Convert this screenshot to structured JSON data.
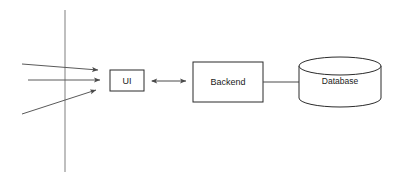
{
  "diagram": {
    "background_color": "#ffffff",
    "stroke_color": "#2b2b2b",
    "nodes": [
      {
        "id": "ui",
        "label": "UI",
        "shape": "rectangle",
        "x": 110,
        "y": 70,
        "width": 34,
        "height": 21
      },
      {
        "id": "backend",
        "label": "Backend",
        "shape": "rectangle",
        "x": 193,
        "y": 62,
        "width": 70,
        "height": 40
      },
      {
        "id": "database",
        "label": "Database",
        "shape": "cylinder",
        "x": 298,
        "y": 57,
        "width": 82,
        "height": 50
      }
    ],
    "connectors": [
      {
        "id": "ui-backend",
        "from": "ui",
        "to": "backend",
        "style": "double-arrow",
        "x1": 150,
        "y1": 81,
        "x2": 188,
        "y2": 81
      },
      {
        "id": "backend-database",
        "from": "backend",
        "to": "database",
        "style": "plain-line",
        "x1": 263,
        "y1": 82,
        "x2": 298,
        "y2": 82
      }
    ],
    "inbound_arrows": [
      {
        "id": "inbound-1",
        "x1": 22,
        "y1": 64,
        "x2": 98,
        "y2": 70
      },
      {
        "id": "inbound-2",
        "x1": 28,
        "y1": 80,
        "x2": 100,
        "y2": 80
      },
      {
        "id": "inbound-3",
        "x1": 22,
        "y1": 114,
        "x2": 96,
        "y2": 90
      }
    ],
    "boundary_line": {
      "id": "boundary",
      "x1": 65,
      "y1": 10,
      "x2": 65,
      "y2": 172
    }
  }
}
